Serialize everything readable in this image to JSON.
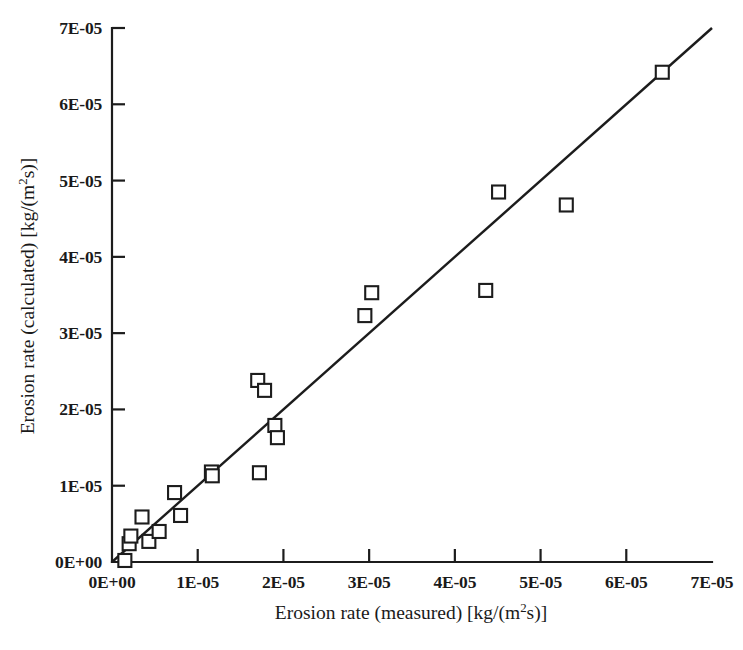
{
  "chart_data": {
    "type": "scatter",
    "title": "",
    "xlabel": "Erosion rate (measured) [kg/(m²s)]",
    "ylabel": "Erosion rate (calculated) [kg/(m²s)]",
    "xlabel_parts": {
      "pre": "Erosion rate (measured) [kg/(m",
      "sup": "2",
      "post": "s)]"
    },
    "ylabel_parts": {
      "pre": "Erosion rate (calculated) [kg/(m",
      "sup": "2",
      "post": "s)]"
    },
    "xlim": [
      0,
      7e-05
    ],
    "ylim": [
      0,
      7e-05
    ],
    "grid": false,
    "legend": "none",
    "xticks": [
      0,
      1e-05,
      2e-05,
      3e-05,
      4e-05,
      5e-05,
      6e-05,
      7e-05
    ],
    "yticks": [
      0,
      1e-05,
      2e-05,
      3e-05,
      4e-05,
      5e-05,
      6e-05,
      7e-05
    ],
    "xtick_labels": [
      "0E+00",
      "1E-05",
      "2E-05",
      "3E-05",
      "4E-05",
      "5E-05",
      "6E-05",
      "7E-05"
    ],
    "ytick_labels": [
      "0E+00",
      "1E-05",
      "2E-05",
      "3E-05",
      "4E-05",
      "5E-05",
      "6E-05",
      "7E-05"
    ],
    "marker": "open-square",
    "marker_size": 13,
    "series": [
      {
        "name": "measured vs calculated",
        "x": [
          1.5e-06,
          2e-06,
          2.2e-06,
          3.5e-06,
          4.3e-06,
          5.5e-06,
          7.3e-06,
          8e-06,
          1.16e-05,
          1.17e-05,
          1.7e-05,
          1.78e-05,
          1.72e-05,
          1.9e-05,
          1.93e-05,
          2.95e-05,
          3.03e-05,
          4.36e-05,
          4.51e-05,
          5.3e-05,
          6.42e-05
        ],
        "y": [
          2e-07,
          2.4e-06,
          3.4e-06,
          5.9e-06,
          2.7e-06,
          4e-06,
          9.1e-06,
          6.1e-06,
          1.18e-05,
          1.13e-05,
          2.38e-05,
          2.25e-05,
          1.17e-05,
          1.79e-05,
          1.63e-05,
          3.23e-05,
          3.53e-05,
          3.56e-05,
          4.85e-05,
          4.68e-05,
          6.42e-05
        ]
      }
    ],
    "reference_line": {
      "name": "1:1 parity line",
      "x": [
        0,
        7e-05
      ],
      "y": [
        0,
        7e-05
      ]
    }
  }
}
